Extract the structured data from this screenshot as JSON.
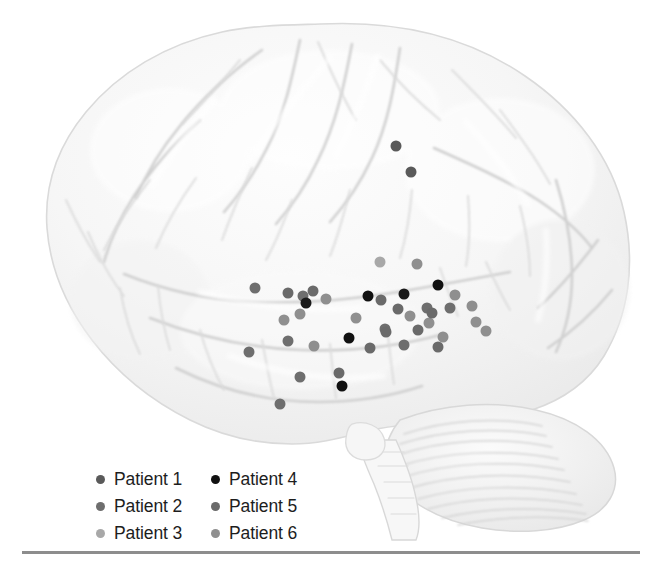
{
  "figure": {
    "background_color": "#ffffff",
    "brain_fill": "#f4f4f4",
    "brain_outline": "#d7d7d7",
    "sulci_color": "#d2d2d2",
    "rule_color": "#8d8d8d"
  },
  "legend": {
    "name": "patient-legend",
    "columns": 2,
    "items": [
      {
        "label": "Patient 1",
        "color": "#5a5a5a"
      },
      {
        "label": "Patient 2",
        "color": "#6e6e6e"
      },
      {
        "label": "Patient 3",
        "color": "#a8a8a8"
      },
      {
        "label": "Patient 4",
        "color": "#111111"
      },
      {
        "label": "Patient 5",
        "color": "#6a6a6a"
      },
      {
        "label": "Patient 6",
        "color": "#8f8f8f"
      }
    ]
  },
  "electrodes": {
    "name": "electrode-markers",
    "radius_px": 5.5,
    "points": [
      {
        "x": 396,
        "y": 146,
        "color": "#5a5a5a",
        "patient": "Patient 1"
      },
      {
        "x": 411,
        "y": 172,
        "color": "#5a5a5a",
        "patient": "Patient 1"
      },
      {
        "x": 380,
        "y": 262,
        "color": "#a8a8a8",
        "patient": "Patient 3"
      },
      {
        "x": 417,
        "y": 264,
        "color": "#8f8f8f",
        "patient": "Patient 6"
      },
      {
        "x": 438,
        "y": 285,
        "color": "#111111",
        "patient": "Patient 4"
      },
      {
        "x": 455,
        "y": 295,
        "color": "#8f8f8f",
        "patient": "Patient 6"
      },
      {
        "x": 255,
        "y": 288,
        "color": "#6e6e6e",
        "patient": "Patient 2"
      },
      {
        "x": 288,
        "y": 293,
        "color": "#6a6a6a",
        "patient": "Patient 5"
      },
      {
        "x": 303,
        "y": 296,
        "color": "#6e6e6e",
        "patient": "Patient 2"
      },
      {
        "x": 313,
        "y": 291,
        "color": "#6a6a6a",
        "patient": "Patient 5"
      },
      {
        "x": 306,
        "y": 303,
        "color": "#1a1a1a",
        "patient": "Patient 4"
      },
      {
        "x": 326,
        "y": 299,
        "color": "#8f8f8f",
        "patient": "Patient 6"
      },
      {
        "x": 368,
        "y": 296,
        "color": "#111111",
        "patient": "Patient 4"
      },
      {
        "x": 381,
        "y": 300,
        "color": "#6a6a6a",
        "patient": "Patient 5"
      },
      {
        "x": 404,
        "y": 294,
        "color": "#1a1a1a",
        "patient": "Patient 4"
      },
      {
        "x": 284,
        "y": 320,
        "color": "#8f8f8f",
        "patient": "Patient 6"
      },
      {
        "x": 300,
        "y": 314,
        "color": "#8f8f8f",
        "patient": "Patient 6"
      },
      {
        "x": 356,
        "y": 318,
        "color": "#8f8f8f",
        "patient": "Patient 6"
      },
      {
        "x": 398,
        "y": 309,
        "color": "#6a6a6a",
        "patient": "Patient 5"
      },
      {
        "x": 410,
        "y": 316,
        "color": "#8f8f8f",
        "patient": "Patient 6"
      },
      {
        "x": 427,
        "y": 308,
        "color": "#6e6e6e",
        "patient": "Patient 2"
      },
      {
        "x": 450,
        "y": 308,
        "color": "#6e6e6e",
        "patient": "Patient 2"
      },
      {
        "x": 472,
        "y": 306,
        "color": "#8f8f8f",
        "patient": "Patient 6"
      },
      {
        "x": 476,
        "y": 322,
        "color": "#8f8f8f",
        "patient": "Patient 6"
      },
      {
        "x": 349,
        "y": 338,
        "color": "#111111",
        "patient": "Patient 4"
      },
      {
        "x": 385,
        "y": 329,
        "color": "#6e6e6e",
        "patient": "Patient 2"
      },
      {
        "x": 386,
        "y": 332,
        "color": "#6a6a6a",
        "patient": "Patient 5"
      },
      {
        "x": 418,
        "y": 330,
        "color": "#6a6a6a",
        "patient": "Patient 5"
      },
      {
        "x": 429,
        "y": 323,
        "color": "#8f8f8f",
        "patient": "Patient 6"
      },
      {
        "x": 443,
        "y": 337,
        "color": "#8f8f8f",
        "patient": "Patient 6"
      },
      {
        "x": 432,
        "y": 313,
        "color": "#6a6a6a",
        "patient": "Patient 5"
      },
      {
        "x": 486,
        "y": 331,
        "color": "#8f8f8f",
        "patient": "Patient 6"
      },
      {
        "x": 288,
        "y": 341,
        "color": "#6e6e6e",
        "patient": "Patient 2"
      },
      {
        "x": 249,
        "y": 352,
        "color": "#6e6e6e",
        "patient": "Patient 2"
      },
      {
        "x": 314,
        "y": 346,
        "color": "#8f8f8f",
        "patient": "Patient 6"
      },
      {
        "x": 370,
        "y": 348,
        "color": "#6a6a6a",
        "patient": "Patient 5"
      },
      {
        "x": 404,
        "y": 345,
        "color": "#6e6e6e",
        "patient": "Patient 2"
      },
      {
        "x": 438,
        "y": 347,
        "color": "#6a6a6a",
        "patient": "Patient 5"
      },
      {
        "x": 300,
        "y": 377,
        "color": "#6e6e6e",
        "patient": "Patient 2"
      },
      {
        "x": 339,
        "y": 373,
        "color": "#6a6a6a",
        "patient": "Patient 5"
      },
      {
        "x": 342,
        "y": 386,
        "color": "#111111",
        "patient": "Patient 4"
      },
      {
        "x": 280,
        "y": 404,
        "color": "#6e6e6e",
        "patient": "Patient 2"
      }
    ]
  }
}
